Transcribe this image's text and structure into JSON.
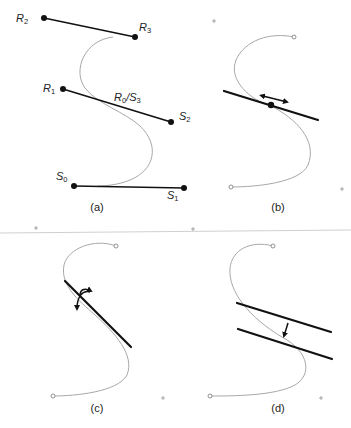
{
  "figure": {
    "panels": [
      {
        "id": "a",
        "caption": "(a)"
      },
      {
        "id": "b",
        "caption": "(b)"
      },
      {
        "id": "c",
        "caption": "(c)"
      },
      {
        "id": "d",
        "caption": "(d)"
      }
    ],
    "labels": {
      "R2": {
        "base": "R",
        "sub": "2"
      },
      "R3": {
        "base": "R",
        "sub": "3"
      },
      "R1": {
        "base": "R",
        "sub": "1"
      },
      "R0S3": {
        "base1": "R",
        "sub1": "0",
        "slash": "/",
        "base2": "S",
        "sub2": "3"
      },
      "S2": {
        "base": "S",
        "sub": "2"
      },
      "S0": {
        "base": "S",
        "sub": "0"
      },
      "S1": {
        "base": "S",
        "sub": "1"
      }
    },
    "colors": {
      "curve": "#a8a8a8",
      "control_lines": "#111111",
      "background": "#ffffff"
    }
  }
}
